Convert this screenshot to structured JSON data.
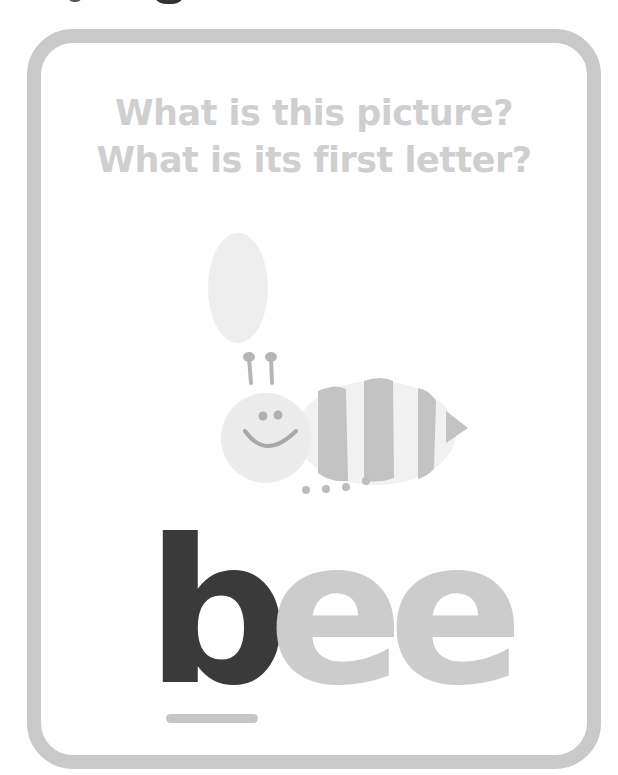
{
  "card": {
    "question_line_1": "What is this picture?",
    "question_line_2": "What is its first letter?",
    "picture": "bee-illustration",
    "word": {
      "first_letter": "b",
      "rest": [
        "e",
        "e"
      ],
      "full": "bee"
    }
  },
  "colors": {
    "border": "#c9c9c9",
    "question_text": "#cfcfcf",
    "first_letter": "#3a3a3a",
    "rest_letters": "#cccccc",
    "underline": "#c6c6c6"
  }
}
